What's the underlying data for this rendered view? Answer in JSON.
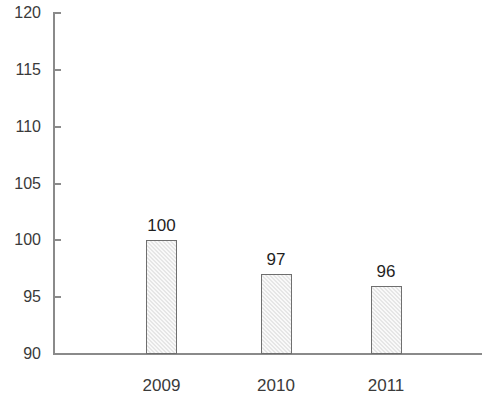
{
  "chart_data": {
    "type": "bar",
    "title": "",
    "subtitle": "",
    "xlabel": "",
    "ylabel": "",
    "categories": [
      "2009",
      "2010",
      "2011"
    ],
    "values": [
      100,
      97,
      96
    ],
    "data_labels": [
      "100",
      "97",
      "96"
    ],
    "ylim": [
      90,
      120
    ],
    "ytick_step": 5,
    "ytick_labels": [
      "90",
      "95",
      "100",
      "105",
      "110",
      "115",
      "120"
    ],
    "ytick_values": [
      90,
      95,
      100,
      105,
      110,
      115,
      120
    ],
    "grid": false,
    "legend": false,
    "legend_position": "none",
    "series": [
      {
        "name": "",
        "values": [
          100,
          97,
          96
        ]
      }
    ],
    "colors": {
      "bar_fill": "#e6e6e6",
      "bar_border": "#6f6f6f",
      "axis": "#8a8a8a",
      "text": "#2b2b2b",
      "background": "#ffffff"
    }
  }
}
